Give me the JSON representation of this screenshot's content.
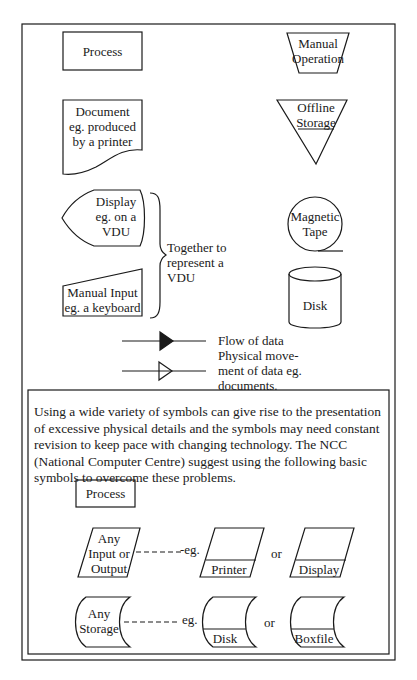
{
  "symbols": {
    "process": {
      "label": "Process"
    },
    "manual_operation": {
      "line1": "Manual",
      "line2": "Operation"
    },
    "document": {
      "line1": "Document",
      "line2": "eg. produced",
      "line3": "by a printer"
    },
    "offline_storage": {
      "line1": "Offline",
      "line2": "Storage"
    },
    "display": {
      "line1": "Display",
      "line2": "eg. on a",
      "line3": "VDU"
    },
    "manual_input": {
      "line1": "Manual Input",
      "line2": "eg. a keyboard"
    },
    "vdu_brace_note": {
      "line1": "Together to",
      "line2": "represent a",
      "line3": "VDU"
    },
    "magnetic_tape": {
      "line1": "Magnetic",
      "line2": "Tape"
    },
    "disk": {
      "label": "Disk"
    },
    "arrows": {
      "line1": "Flow of data",
      "line2": "Physical move-",
      "line3": "ment of data eg.",
      "line4": "documents."
    }
  },
  "ncc_panel": {
    "paragraph": "Using a wide variety of symbols can give rise to the presentation of excessive physical details and the symbols may need constant revision to keep pace with changing technology. The NCC (National Computer Centre) suggest using the following basic symbols to overcome these problems.",
    "process": {
      "label": "Process"
    },
    "io": {
      "line1": "Any",
      "line2": "Input or",
      "line3": "Output"
    },
    "io_eg": "-eg.",
    "printer": "Printer",
    "or1": "or",
    "display": "Display",
    "storage": {
      "line1": "Any",
      "line2": "Storage"
    },
    "storage_eg": "eg.",
    "disk": "Disk",
    "or2": "or",
    "boxfile": "Boxfile"
  },
  "colors": {
    "ink": "#1a1a1a",
    "paper": "#ffffff"
  }
}
